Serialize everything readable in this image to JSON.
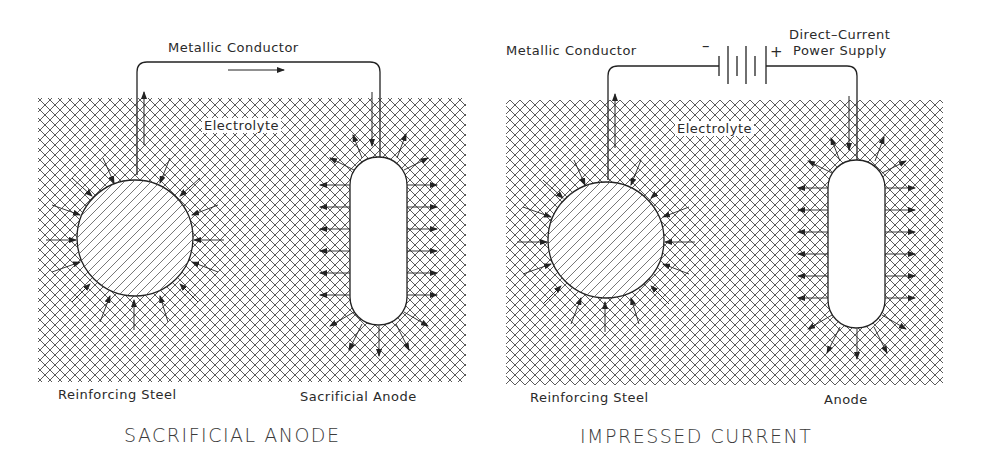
{
  "panels": [
    {
      "id": "sacrificial",
      "title": "SACRIFICIAL ANODE",
      "labels": {
        "conductor": "Metallic Conductor",
        "electrolyte": "Electrolyte",
        "steel": "Reinforcing Steel",
        "anode": "Sacrificial Anode"
      }
    },
    {
      "id": "impressed",
      "title": "IMPRESSED CURRENT",
      "labels": {
        "conductor": "Metallic Conductor",
        "electrolyte": "Electrolyte",
        "steel": "Reinforcing Steel",
        "anode": "Anode",
        "power_supply_line1": "Direct–Current",
        "power_supply_line2": "Power Supply",
        "minus": "–",
        "plus": "+"
      }
    }
  ],
  "colors": {
    "line": "#2a2a2a",
    "hatch": "#444444",
    "background": "#ffffff"
  }
}
